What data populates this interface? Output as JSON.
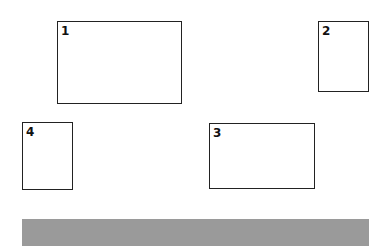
{
  "boxes": [
    {
      "label": "1"
    },
    {
      "label": "2"
    },
    {
      "label": "3"
    },
    {
      "label": "4"
    }
  ],
  "colors": {
    "border": "#222222",
    "band": "#9a9a9a",
    "background": "#ffffff"
  }
}
